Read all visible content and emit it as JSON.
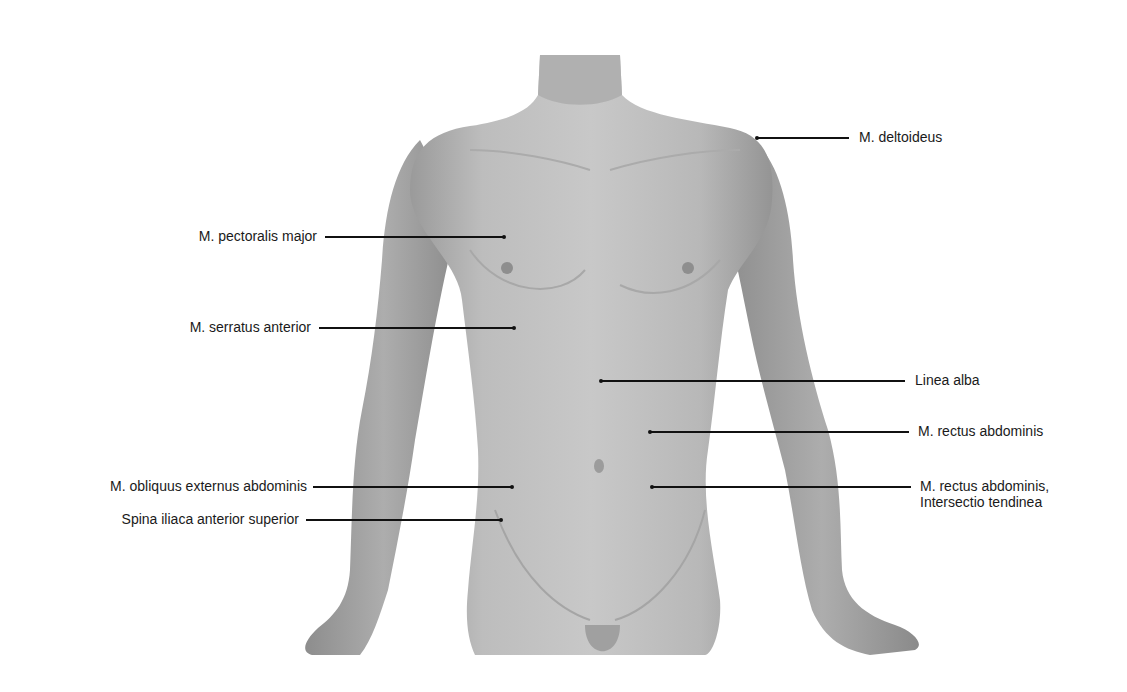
{
  "figure": {
    "type": "anatomical-surface-diagram"
  },
  "labels": [
    {
      "id": "deltoideus",
      "text": "M. deltoideus",
      "side": "right",
      "text_x": 859,
      "y": 137,
      "line_x1": 757,
      "line_x2": 849
    },
    {
      "id": "pectoralis-major",
      "text": "M. pectoralis major",
      "side": "left",
      "text_right": 317,
      "y": 236,
      "line_x1": 325,
      "line_x2": 504
    },
    {
      "id": "serratus-anterior",
      "text": "M. serratus anterior",
      "side": "left",
      "text_right": 311,
      "y": 327,
      "line_x1": 319,
      "line_x2": 514
    },
    {
      "id": "linea-alba",
      "text": "Linea alba",
      "side": "right",
      "text_x": 915,
      "y": 380,
      "line_x1": 601,
      "line_x2": 905
    },
    {
      "id": "rectus-abdominis",
      "text": "M. rectus abdominis",
      "side": "right",
      "text_x": 918,
      "y": 431,
      "line_x1": 650,
      "line_x2": 909
    },
    {
      "id": "rectus-intersectio",
      "text": "M. rectus abdominis,",
      "text2": "Intersectio tendinea",
      "side": "right",
      "text_x": 920,
      "y": 486,
      "line_x1": 652,
      "line_x2": 911
    },
    {
      "id": "obliquus-externus",
      "text": "M. obliquus externus abdominis",
      "side": "left",
      "text_right": 307,
      "y": 486,
      "line_x1": 313,
      "line_x2": 512
    },
    {
      "id": "spina-iliaca",
      "text": "Spina iliaca anterior superior",
      "side": "left",
      "text_right": 299,
      "y": 519,
      "line_x1": 306,
      "line_x2": 501
    }
  ],
  "colors": {
    "background": "#ffffff",
    "skin_light": "#c9c9c9",
    "skin_mid": "#b3b3b3",
    "skin_dark": "#8f8f8f",
    "text": "#1a1a1a",
    "leader": "#111111"
  }
}
